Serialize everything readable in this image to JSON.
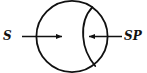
{
  "figure": {
    "type": "geometric-diagram",
    "background_color": "#ffffff",
    "stroke_color": "#111111",
    "stroke_width": 1.8,
    "circle": {
      "name": "outer-circle",
      "center_x": 72,
      "center_y": 36.5,
      "radius": 36
    },
    "inner_arc": {
      "name": "crescent-arc",
      "start_x": 92,
      "start_y": 7,
      "end_x": 95,
      "end_y": 66,
      "bulge_x": 83,
      "bulge_y": 36.5
    },
    "arrows": [
      {
        "name": "arrow-s",
        "label": "S",
        "direction": "right",
        "tail_x": 22,
        "tip_x": 67,
        "y": 36.5
      },
      {
        "name": "arrow-sp",
        "label": "SP",
        "direction": "left",
        "tail_x": 122,
        "tip_x": 84,
        "y": 36.5
      }
    ]
  },
  "labels": {
    "left": "S",
    "right": "SP"
  }
}
